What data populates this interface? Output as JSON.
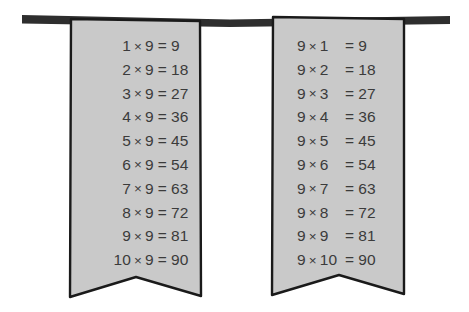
{
  "scene": {
    "title": "Nine times table on two hanging banners",
    "background_color": "#ffffff",
    "rope": {
      "name": "horizontal hanging bar",
      "color": "#2e2e2e"
    },
    "banner_fill": "#c9c9c9",
    "banner_stroke": "#1a1a1a",
    "text_color": "#3b3b3b",
    "multiply_sign": "×",
    "equals_sign": "="
  },
  "banners": [
    {
      "id": "left-banner",
      "label": "Multiplicand first banner",
      "layout": "inline",
      "rows": [
        {
          "lhs": "1",
          "op": "×",
          "factor": "9",
          "eq": "=",
          "result": "9"
        },
        {
          "lhs": "2",
          "op": "×",
          "factor": "9",
          "eq": "=",
          "result": "18"
        },
        {
          "lhs": "3",
          "op": "×",
          "factor": "9",
          "eq": "=",
          "result": "27"
        },
        {
          "lhs": "4",
          "op": "×",
          "factor": "9",
          "eq": "=",
          "result": "36"
        },
        {
          "lhs": "5",
          "op": "×",
          "factor": "9",
          "eq": "=",
          "result": "45"
        },
        {
          "lhs": "6",
          "op": "×",
          "factor": "9",
          "eq": "=",
          "result": "54"
        },
        {
          "lhs": "7",
          "op": "×",
          "factor": "9",
          "eq": "=",
          "result": "63"
        },
        {
          "lhs": "8",
          "op": "×",
          "factor": "9",
          "eq": "=",
          "result": "72"
        },
        {
          "lhs": "9",
          "op": "×",
          "factor": "9",
          "eq": "=",
          "result": "81"
        },
        {
          "lhs": "10",
          "op": "×",
          "factor": "9",
          "eq": "=",
          "result": "90"
        }
      ]
    },
    {
      "id": "right-banner",
      "label": "Nine first banner",
      "layout": "columns",
      "rows": [
        {
          "lhs": "9",
          "op": "×",
          "factor": "1",
          "eq": "=",
          "result": "9"
        },
        {
          "lhs": "9",
          "op": "×",
          "factor": "2",
          "eq": "=",
          "result": "18"
        },
        {
          "lhs": "9",
          "op": "×",
          "factor": "3",
          "eq": "=",
          "result": "27"
        },
        {
          "lhs": "9",
          "op": "×",
          "factor": "4",
          "eq": "=",
          "result": "36"
        },
        {
          "lhs": "9",
          "op": "×",
          "factor": "5",
          "eq": "=",
          "result": "45"
        },
        {
          "lhs": "9",
          "op": "×",
          "factor": "6",
          "eq": "=",
          "result": "54"
        },
        {
          "lhs": "9",
          "op": "×",
          "factor": "7",
          "eq": "=",
          "result": "63"
        },
        {
          "lhs": "9",
          "op": "×",
          "factor": "8",
          "eq": "=",
          "result": "72"
        },
        {
          "lhs": "9",
          "op": "×",
          "factor": "9",
          "eq": "=",
          "result": "81"
        },
        {
          "lhs": "9",
          "op": "×",
          "factor": "10",
          "eq": "=",
          "result": "90"
        }
      ]
    }
  ]
}
